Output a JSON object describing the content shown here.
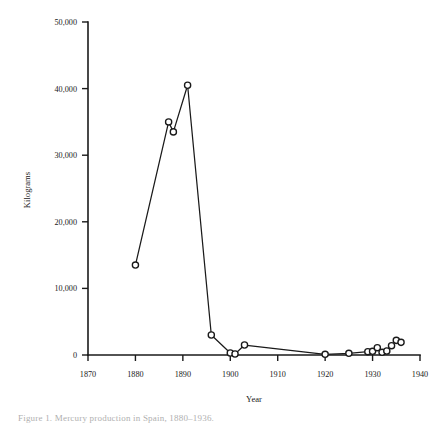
{
  "figure": {
    "caption": "Figure 1. Mercury production in Spain, 1880–1936.",
    "background_color": "#ffffff",
    "ink_color": "#1a1a1a"
  },
  "chart_data": {
    "type": "line",
    "title": "",
    "xlabel": "Year",
    "ylabel": "Kilograms",
    "xlim": [
      1870,
      1940
    ],
    "ylim": [
      0,
      50000
    ],
    "grid": false,
    "legend": null,
    "marker": "open-circle",
    "x_ticks": [
      1870,
      1880,
      1890,
      1900,
      1910,
      1920,
      1930,
      1940
    ],
    "x_tick_labels": [
      "1870",
      "1880",
      "1890",
      "1900",
      "1910",
      "1920",
      "1930",
      "1940"
    ],
    "y_ticks": [
      0,
      10000,
      20000,
      30000,
      40000,
      50000
    ],
    "y_tick_labels": [
      "0",
      "10,000",
      "20,000",
      "30,000",
      "40,000",
      "50,000"
    ],
    "series": [
      {
        "name": "Kilograms",
        "x": [
          1880,
          1887,
          1888,
          1891,
          1896,
          1900,
          1901,
          1903,
          1920,
          1925,
          1929,
          1930,
          1931,
          1932,
          1933,
          1934,
          1935,
          1936
        ],
        "y": [
          13500,
          35000,
          33500,
          40500,
          3000,
          300,
          150,
          1500,
          100,
          250,
          500,
          550,
          1100,
          400,
          600,
          1400,
          2200,
          1900
        ]
      }
    ]
  }
}
